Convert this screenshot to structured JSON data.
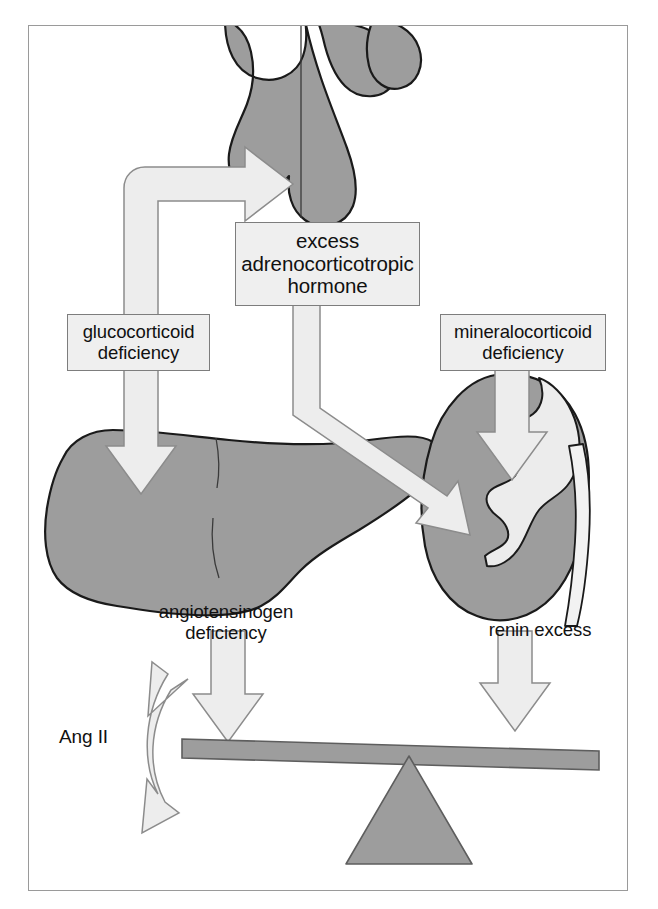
{
  "figure": {
    "caption": "",
    "frame": {
      "border_color": "#9a9a9a",
      "background": "#ffffff"
    },
    "colors": {
      "organ_fill": "#9d9d9d",
      "organ_outline": "#1a1a1a",
      "arrow_fill": "#ededed",
      "arrow_outline": "#8c8c8c",
      "box_fill": "#efefef",
      "box_border": "#7d7d7d",
      "beam_fill": "#9d9d9d",
      "fulcrum_fill": "#9d9d9d",
      "text": "#111111"
    }
  },
  "organs": [
    {
      "id": "pituitary",
      "name": "pituitary-gland",
      "label": ""
    },
    {
      "id": "liver",
      "name": "liver",
      "label": ""
    },
    {
      "id": "kidney",
      "name": "kidney",
      "label": ""
    }
  ],
  "boxes": {
    "acth": {
      "text": "excess\nadrenocorticotropic\nhormone",
      "line1": "excess",
      "line2": "adrenocorticotropic",
      "line3": "hormone"
    },
    "glucocorticoid": {
      "text": "glucocorticoid\ndeficiency",
      "line1": "glucocorticoid",
      "line2": "deficiency"
    },
    "mineralocorticoid": {
      "text": "mineralocorticoid\ndeficiency",
      "line1": "mineralocorticoid",
      "line2": "deficiency"
    }
  },
  "labels": {
    "angiotensinogen_deficiency": "angiotensinogen\ndeficiency",
    "renin_excess": "renin excess",
    "ang_ii": "Ang II"
  },
  "flows": [
    {
      "id": "flow-acth-to-pituitary",
      "name": "arrow-to-pituitary",
      "from": "glucocorticoid deficiency",
      "to": "pituitary",
      "direction": "up-then-right",
      "style": "hollow-block-arrow"
    },
    {
      "id": "flow-gluco-to-liver",
      "name": "arrow-glucocorticoid-to-liver",
      "from": "glucocorticoid deficiency",
      "to": "liver",
      "direction": "down",
      "style": "hollow-block-arrow"
    },
    {
      "id": "flow-acth-to-kidney",
      "name": "arrow-acth-to-kidney",
      "from": "excess adrenocorticotropic hormone",
      "to": "kidney",
      "direction": "down-then-diagonal",
      "style": "hollow-block-arrow"
    },
    {
      "id": "flow-mineralo-to-kidney",
      "name": "arrow-mineralocorticoid-to-kidney",
      "from": "mineralocorticoid deficiency",
      "to": "kidney",
      "direction": "down",
      "style": "hollow-block-arrow"
    },
    {
      "id": "flow-angiotensinogen-to-beam",
      "name": "arrow-angiotensinogen-to-beam",
      "from": "angiotensinogen deficiency",
      "to": "balance beam",
      "direction": "down",
      "style": "hollow-block-arrow"
    },
    {
      "id": "flow-renin-to-beam",
      "name": "arrow-renin-to-beam",
      "from": "renin excess",
      "to": "balance beam",
      "direction": "down",
      "style": "hollow-block-arrow"
    },
    {
      "id": "flow-angii-swing",
      "name": "arrow-ang-ii-double-curved",
      "from": "Ang II",
      "to": "balance beam",
      "direction": "bidirectional-curved",
      "style": "hollow-curved-double-arrow"
    }
  ],
  "balance": {
    "name": "seesaw-balance",
    "beam_label": "",
    "fulcrum_label": "",
    "tilt": "left side raised"
  }
}
